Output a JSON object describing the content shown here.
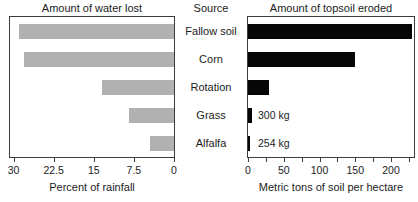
{
  "source_column": {
    "title": "Source",
    "labels": [
      "Fallow soil",
      "Corn",
      "Rotation",
      "Grass",
      "Alfalfa"
    ]
  },
  "chart_data": [
    {
      "type": "bar",
      "panel": "left",
      "title": "Amount of water lost",
      "xlabel": "Percent of rainfall",
      "orientation": "horizontal, bars grow right-to-left toward shared center",
      "categories": [
        "Fallow soil",
        "Corn",
        "Rotation",
        "Grass",
        "Alfalfa"
      ],
      "values": [
        29,
        28,
        13.5,
        8.5,
        4.5
      ],
      "axis": {
        "range": [
          0,
          30
        ],
        "reversed": true,
        "ticks": [
          30,
          22.5,
          15,
          7.5,
          0
        ],
        "tick_labels": [
          "30",
          "22.5",
          "15",
          "7.5",
          "0"
        ]
      },
      "legend": "none",
      "grid": false,
      "bar_color": "#b1b1b1"
    },
    {
      "type": "bar",
      "panel": "right",
      "title": "Amount of topsoil eroded",
      "xlabel": "Metric tons of soil per hectare",
      "orientation": "horizontal, bars grow left-to-right from shared center",
      "categories": [
        "Fallow soil",
        "Corn",
        "Rotation",
        "Grass",
        "Alfalfa"
      ],
      "values": [
        230,
        150,
        29,
        0.3,
        0.254
      ],
      "annotations": [
        "",
        "",
        "",
        "300 kg",
        "254 kg"
      ],
      "axis": {
        "range": [
          0,
          235
        ],
        "major_ticks": [
          0,
          50,
          100,
          150,
          200
        ],
        "tick_labels": [
          "0",
          "50",
          "100",
          "150",
          "200"
        ],
        "minor_tick_step": 25,
        "minor_tick_max": 225
      },
      "legend": "none",
      "grid": false,
      "bar_color": "#060606"
    }
  ],
  "colors": {
    "bar_gray": "#b1b1b1",
    "bar_black": "#060606",
    "frame": "#3d3d3d",
    "text": "#1c1c1c",
    "background": "#ffffff"
  }
}
